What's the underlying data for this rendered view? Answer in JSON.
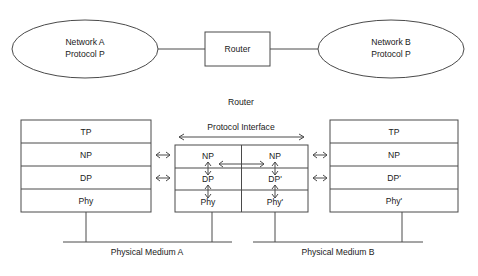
{
  "figure": {
    "top_diagram": {
      "left_cloud": {
        "line1": "Network A",
        "line2": "Protocol P"
      },
      "router_box": {
        "label": "Router"
      },
      "right_cloud": {
        "line1": "Network B",
        "line2": "Protocol P"
      }
    },
    "bottom_diagram": {
      "router_caption": "Router",
      "protocol_interface_label": "Protocol Interface",
      "left_stack": {
        "layers": [
          "TP",
          "NP",
          "DP",
          "Phy"
        ]
      },
      "router_stack_left": {
        "layers": [
          "NP",
          "DP",
          "Phy"
        ]
      },
      "router_stack_right": {
        "layers": [
          "NP",
          "DP'",
          "Phy'"
        ]
      },
      "right_stack": {
        "layers": [
          "TP",
          "NP",
          "DP'",
          "Phy'"
        ]
      },
      "medium_a_label": "Physical Medium A",
      "medium_b_label": "Physical Medium B"
    },
    "colors": {
      "stroke": "#4a4a4a",
      "text": "#1a1a1a",
      "background": "#ffffff"
    }
  }
}
